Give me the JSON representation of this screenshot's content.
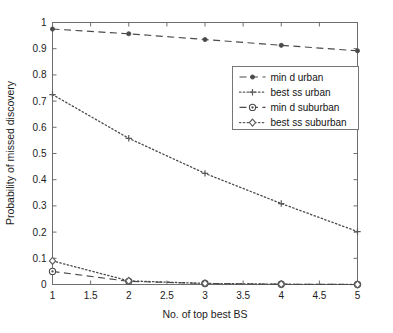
{
  "chart_data": {
    "type": "line",
    "title": "",
    "xlabel": "No. of top best BS",
    "ylabel": "Probability of missed discovery",
    "x": [
      1,
      2,
      3,
      4,
      5
    ],
    "xlim": [
      1,
      5
    ],
    "ylim": [
      0,
      1
    ],
    "xticks": [
      1,
      1.5,
      2,
      2.5,
      3,
      3.5,
      4,
      4.5,
      5
    ],
    "xtick_labels": [
      "1",
      "1.5",
      "2",
      "2.5",
      "3",
      "3.5",
      "4",
      "4.5",
      "5"
    ],
    "yticks": [
      0,
      0.1,
      0.2,
      0.3,
      0.4,
      0.5,
      0.6,
      0.7,
      0.8,
      0.9,
      1
    ],
    "ytick_labels": [
      "0",
      "0.1",
      "0.2",
      "0.3",
      "0.4",
      "0.5",
      "0.6",
      "0.7",
      "0.8",
      "0.9",
      "1"
    ],
    "grid": false,
    "legend_position": "upper right",
    "series": [
      {
        "name": "min d urban",
        "values": [
          0.975,
          0.957,
          0.935,
          0.913,
          0.892
        ],
        "line_style": "dashed",
        "marker": "dot",
        "color": "#4a4a4a"
      },
      {
        "name": "best ss urban",
        "values": [
          0.725,
          0.558,
          0.424,
          0.309,
          0.202
        ],
        "line_style": "dotted",
        "marker": "plus",
        "color": "#5a5a5a"
      },
      {
        "name": "min d suburban",
        "values": [
          0.05,
          0.012,
          0.004,
          0.001,
          0.0
        ],
        "line_style": "dashed",
        "marker": "circle-dot",
        "color": "#4a4a4a"
      },
      {
        "name": "best ss suburban",
        "values": [
          0.09,
          0.014,
          0.004,
          0.001,
          0.0
        ],
        "line_style": "dotted",
        "marker": "diamond",
        "color": "#5a5a5a"
      }
    ]
  },
  "legend": {
    "entries": [
      {
        "label": "min d urban"
      },
      {
        "label": "best ss urban"
      },
      {
        "label": "min d suburban"
      },
      {
        "label": "best ss suburban"
      }
    ]
  },
  "colors": {
    "axis": "#6e6e6e",
    "text": "#1c1c1c",
    "series_dark": "#4a4a4a",
    "series_mid": "#5a5a5a",
    "background": "#ffffff"
  }
}
